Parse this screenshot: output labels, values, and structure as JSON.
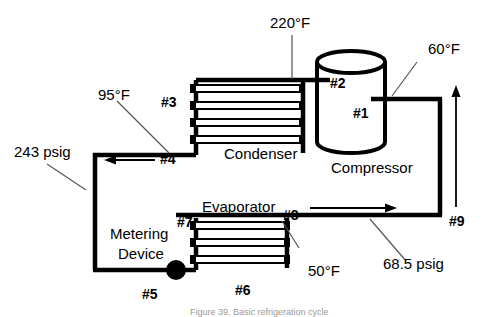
{
  "figure": {
    "caption": "Figure 39. Basic refrigeration cycle",
    "components": {
      "condenser": "Condenser",
      "compressor": "Compressor",
      "evaporator": "Evaporator",
      "metering_line1": "Metering",
      "metering_line2": "Device"
    },
    "measurements": {
      "discharge_temp": "220°F",
      "suction_temp": "60°F",
      "liquid_temp": "95°F",
      "evaporator_temp": "50°F",
      "high_pressure": "243 psig",
      "low_pressure": "68.5 psig"
    },
    "nodes": {
      "n1": "#1",
      "n2": "#2",
      "n3": "#3",
      "n4": "#4",
      "n5": "#5",
      "n6": "#6",
      "n7": "#7",
      "n8": "#8",
      "n9": "#9"
    },
    "colors": {
      "line": "#000000",
      "background": "#ffffff",
      "caption": "#9a9a9a"
    }
  }
}
